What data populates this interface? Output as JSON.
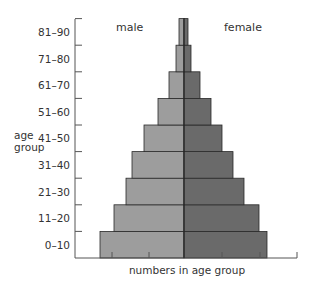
{
  "chart_data": {
    "type": "bar",
    "subtype": "population-pyramid",
    "title": "",
    "xlabel": "numbers in age group",
    "ylabel": "age group",
    "categories": [
      "0–10",
      "11–20",
      "21–30",
      "31–40",
      "41–50",
      "51–60",
      "61–70",
      "71–80",
      "81–90"
    ],
    "series": [
      {
        "name": "male",
        "color": "#9d9d9d",
        "values": [
          84,
          70,
          58,
          52,
          40,
          26,
          15,
          8,
          5
        ]
      },
      {
        "name": "female",
        "color": "#6a6a6a",
        "values": [
          83,
          75,
          60,
          49,
          38,
          27,
          16,
          7,
          4
        ]
      }
    ],
    "units": "relative bar half-width (px), no numeric scale shown",
    "grid": false,
    "legend_position": "top, inline labels"
  },
  "labels": {
    "male": "male",
    "female": "female",
    "xlabel": "numbers in age group",
    "ylabel_line1": "age",
    "ylabel_line2": "group"
  }
}
